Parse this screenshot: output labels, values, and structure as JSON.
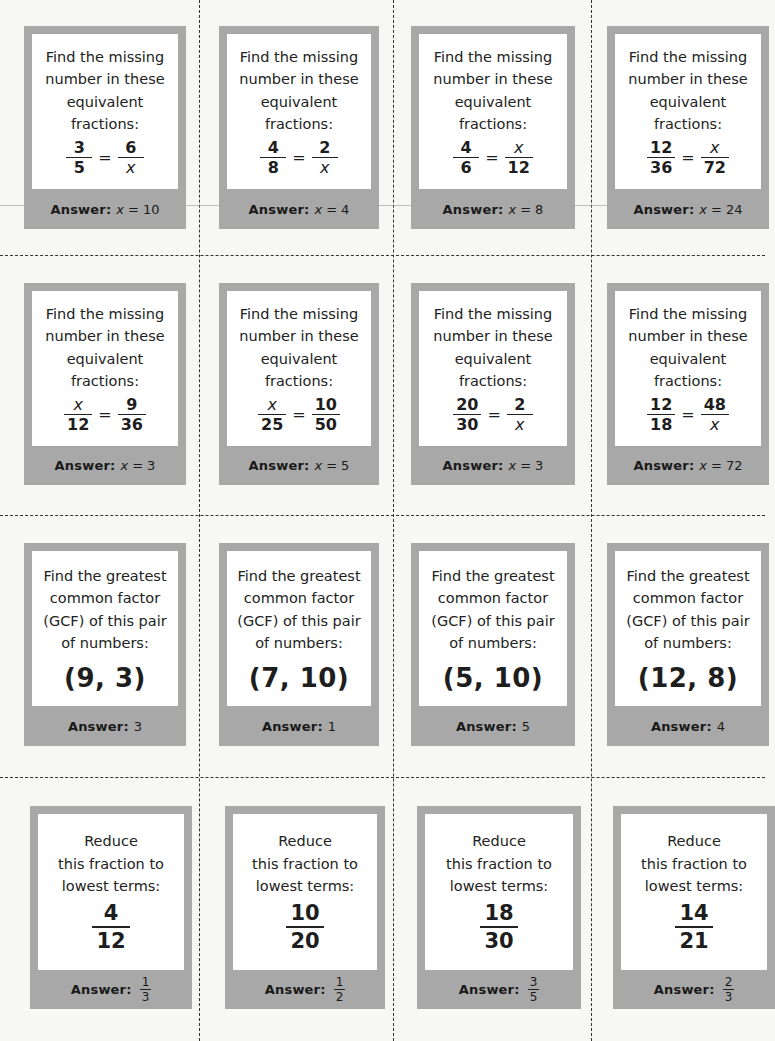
{
  "page": {
    "background": "#f7f7f5",
    "card_border_color": "#a8a8a8",
    "card_inner_color": "#ffffff"
  },
  "labels": {
    "answer": "Answer:",
    "equals": "=",
    "variable": "x"
  },
  "rows": [
    {
      "type": "equivalent-fractions",
      "prompt_lines": [
        "Find the missing",
        "number in these",
        "equivalent",
        "fractions:"
      ],
      "cards": [
        {
          "left": {
            "num": "3",
            "den": "5"
          },
          "right": {
            "num": "6",
            "den": "x"
          },
          "answer": "10"
        },
        {
          "left": {
            "num": "4",
            "den": "8"
          },
          "right": {
            "num": "2",
            "den": "x"
          },
          "answer": "4"
        },
        {
          "left": {
            "num": "4",
            "den": "6"
          },
          "right": {
            "num": "x",
            "den": "12"
          },
          "answer": "8"
        },
        {
          "left": {
            "num": "12",
            "den": "36"
          },
          "right": {
            "num": "x",
            "den": "72"
          },
          "answer": "24"
        }
      ]
    },
    {
      "type": "equivalent-fractions",
      "prompt_lines": [
        "Find the missing",
        "number in these",
        "equivalent",
        "fractions:"
      ],
      "cards": [
        {
          "left": {
            "num": "x",
            "den": "12"
          },
          "right": {
            "num": "9",
            "den": "36"
          },
          "answer": "3"
        },
        {
          "left": {
            "num": "x",
            "den": "25"
          },
          "right": {
            "num": "10",
            "den": "50"
          },
          "answer": "5"
        },
        {
          "left": {
            "num": "20",
            "den": "30"
          },
          "right": {
            "num": "2",
            "den": "x"
          },
          "answer": "3"
        },
        {
          "left": {
            "num": "12",
            "den": "18"
          },
          "right": {
            "num": "48",
            "den": "x"
          },
          "answer": "72"
        }
      ]
    },
    {
      "type": "gcf",
      "prompt_lines": [
        "Find the greatest",
        "common factor",
        "(GCF) of this pair",
        "of numbers:"
      ],
      "cards": [
        {
          "pair": "(9, 3)",
          "answer": "3"
        },
        {
          "pair": "(7, 10)",
          "answer": "1"
        },
        {
          "pair": "(5, 10)",
          "answer": "5"
        },
        {
          "pair": "(12, 8)",
          "answer": "4"
        }
      ]
    },
    {
      "type": "reduce",
      "prompt_lines": [
        "Reduce",
        "this fraction to",
        "lowest terms:"
      ],
      "cards": [
        {
          "fraction": {
            "num": "4",
            "den": "12"
          },
          "answer": {
            "num": "1",
            "den": "3"
          }
        },
        {
          "fraction": {
            "num": "10",
            "den": "20"
          },
          "answer": {
            "num": "1",
            "den": "2"
          }
        },
        {
          "fraction": {
            "num": "18",
            "den": "30"
          },
          "answer": {
            "num": "3",
            "den": "5"
          }
        },
        {
          "fraction": {
            "num": "14",
            "den": "21"
          },
          "answer": {
            "num": "2",
            "den": "3"
          }
        }
      ]
    }
  ]
}
